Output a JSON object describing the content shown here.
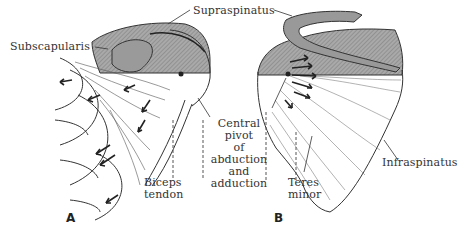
{
  "figure": {
    "panels": [
      {
        "letter": "A",
        "view": "anterior",
        "labels": {
          "subscapularis": "Subscapularis",
          "biceps_line1": "Biceps",
          "biceps_line2": "tendon"
        }
      },
      {
        "letter": "B",
        "view": "posterior",
        "labels": {
          "infraspinatus": "Infraspinatus",
          "teres_line1": "Teres",
          "teres_line2": "minor"
        }
      }
    ],
    "shared_labels": {
      "supraspinatus": "Supraspinatus",
      "pivot_lines": [
        "Central",
        "pivot",
        "of",
        "abduction",
        "and",
        "adduction"
      ]
    },
    "colors": {
      "ink": "#333333",
      "shade": "#8f8f8f",
      "shade_light": "#b5b5b5",
      "background": "#ffffff"
    }
  }
}
